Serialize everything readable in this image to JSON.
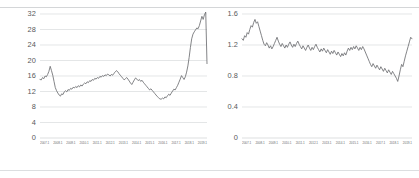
{
  "figure": {
    "background": "#ffffff",
    "rule_color": "#d4d6d8",
    "line_color": "#6d6e71",
    "grid_color": "#d9dbdd"
  },
  "chart_data": [
    {
      "type": "line",
      "title": "",
      "xlabel": "",
      "ylabel": "",
      "ylim": [
        0,
        32
      ],
      "yticks": [
        0,
        4,
        8,
        12,
        16,
        20,
        24,
        28,
        32
      ],
      "ytick_labels": [
        "0",
        "4",
        "8",
        "12",
        "16",
        "20",
        "24",
        "28",
        "32"
      ],
      "grid": true,
      "legend": false,
      "xtick_labels": [
        "2007.1",
        "2008.1",
        "2009.1",
        "2010.1",
        "2011.1",
        "2012.1",
        "2013.1",
        "2014.1",
        "2015.1",
        "2016.1",
        "2017.1",
        "2018.1",
        "2019.1"
      ],
      "values": [
        15.1,
        15.0,
        15.6,
        15.3,
        16.0,
        15.8,
        16.4,
        17.2,
        18.5,
        17.4,
        16.2,
        14.6,
        13.0,
        12.2,
        11.6,
        11.1,
        10.8,
        11.4,
        11.2,
        11.9,
        12.2,
        11.9,
        12.5,
        12.3,
        12.8,
        12.6,
        13.1,
        12.9,
        13.3,
        13.0,
        13.5,
        13.2,
        13.7,
        13.4,
        13.9,
        14.2,
        14.0,
        14.5,
        14.3,
        14.8,
        14.6,
        15.1,
        14.9,
        15.4,
        15.2,
        15.6,
        15.4,
        15.9,
        15.7,
        16.1,
        15.9,
        16.3,
        16.1,
        16.5,
        16.3,
        16.0,
        16.4,
        16.2,
        16.7,
        17.0,
        17.4,
        17.1,
        16.6,
        16.2,
        15.8,
        15.4,
        15.0,
        15.3,
        15.6,
        15.2,
        14.7,
        14.2,
        13.8,
        14.4,
        15.0,
        15.5,
        15.2,
        14.8,
        15.1,
        14.6,
        14.9,
        14.4,
        14.0,
        13.6,
        13.2,
        12.8,
        12.4,
        12.7,
        12.3,
        11.9,
        11.5,
        11.1,
        10.7,
        10.4,
        10.1,
        10.0,
        10.3,
        10.1,
        10.6,
        10.4,
        10.9,
        11.3,
        11.0,
        11.6,
        12.1,
        12.6,
        12.4,
        13.0,
        13.6,
        14.4,
        15.2,
        16.1,
        15.6,
        15.1,
        15.8,
        17.0,
        18.6,
        20.8,
        23.4,
        25.6,
        26.8,
        27.4,
        27.9,
        28.4,
        28.2,
        29.0,
        30.2,
        31.4,
        30.6,
        31.8,
        32.5,
        19.2
      ]
    },
    {
      "type": "line",
      "title": "",
      "xlabel": "",
      "ylabel": "",
      "ylim": [
        0,
        1.6
      ],
      "yticks": [
        0,
        0.4,
        0.8,
        1.2,
        1.6
      ],
      "ytick_labels": [
        "0",
        "0.4",
        "0.8",
        "1.2",
        "1.6"
      ],
      "grid": true,
      "legend": false,
      "xtick_labels": [
        "2007.1",
        "2008.1",
        "2009.1",
        "2010.1",
        "2011.1",
        "2012.1",
        "2013.1",
        "2014.1",
        "2015.1",
        "2016.1",
        "2017.1",
        "2018.1",
        "2019.1"
      ],
      "values": [
        1.28,
        1.26,
        1.32,
        1.3,
        1.36,
        1.34,
        1.4,
        1.45,
        1.43,
        1.49,
        1.53,
        1.48,
        1.5,
        1.44,
        1.38,
        1.32,
        1.26,
        1.21,
        1.19,
        1.23,
        1.2,
        1.16,
        1.19,
        1.15,
        1.18,
        1.22,
        1.26,
        1.3,
        1.25,
        1.21,
        1.18,
        1.22,
        1.19,
        1.16,
        1.2,
        1.17,
        1.21,
        1.24,
        1.2,
        1.17,
        1.21,
        1.18,
        1.22,
        1.25,
        1.21,
        1.18,
        1.15,
        1.19,
        1.16,
        1.13,
        1.17,
        1.2,
        1.16,
        1.13,
        1.17,
        1.14,
        1.18,
        1.21,
        1.17,
        1.14,
        1.11,
        1.15,
        1.12,
        1.16,
        1.13,
        1.1,
        1.14,
        1.11,
        1.08,
        1.12,
        1.09,
        1.13,
        1.1,
        1.07,
        1.11,
        1.08,
        1.05,
        1.09,
        1.06,
        1.1,
        1.07,
        1.12,
        1.16,
        1.13,
        1.17,
        1.14,
        1.18,
        1.15,
        1.19,
        1.16,
        1.13,
        1.17,
        1.14,
        1.18,
        1.15,
        1.11,
        1.07,
        1.03,
        0.99,
        0.95,
        0.92,
        0.96,
        0.93,
        0.9,
        0.94,
        0.91,
        0.88,
        0.92,
        0.89,
        0.86,
        0.9,
        0.87,
        0.84,
        0.88,
        0.85,
        0.82,
        0.86,
        0.83,
        0.8,
        0.77,
        0.73,
        0.8,
        0.88,
        0.95,
        0.92,
        0.99,
        1.06,
        1.12,
        1.18,
        1.24,
        1.3,
        1.28
      ]
    }
  ]
}
